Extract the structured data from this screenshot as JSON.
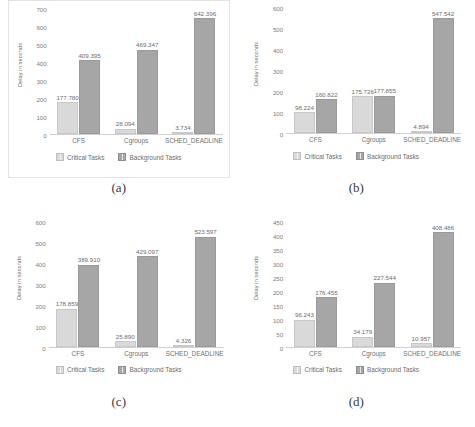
{
  "figure": {
    "background": "#ffffff",
    "colors": {
      "critical": "#d9d9d9",
      "background": "#a6a6a6",
      "text": "#707070",
      "frame": "#e3e3e3"
    }
  },
  "panels": [
    {
      "caption": "(a)",
      "framed": true,
      "chart_data": {
        "type": "bar",
        "title": "",
        "xlabel": "",
        "ylabel": "Delay in seconds",
        "categories": [
          "CFS",
          "Cgroups",
          "SCHED_DEADLINE"
        ],
        "series": [
          {
            "name": "Critical Tasks",
            "values": [
              177.78,
              28.094,
              3.734
            ],
            "labels": [
              "177.780",
              "28.094",
              "3.734"
            ]
          },
          {
            "name": "Background Tasks",
            "values": [
              409.395,
              469.347,
              642.396
            ],
            "labels": [
              "409.395",
              "469.347",
              "642.396"
            ]
          }
        ],
        "yticks": [
          700,
          600,
          500,
          400,
          300,
          200,
          100,
          0
        ],
        "ytick_labels": [
          "700",
          "600",
          "500",
          "400",
          "300",
          "200",
          "100",
          "0"
        ],
        "ylim": [
          0,
          700
        ],
        "grid": false,
        "legend": [
          "Critical Tasks",
          "Background Tasks"
        ],
        "legend_position": "bottom"
      }
    },
    {
      "caption": "(b)",
      "framed": false,
      "chart_data": {
        "type": "bar",
        "title": "",
        "xlabel": "",
        "ylabel": "Delay in seconds",
        "categories": [
          "CFS",
          "Cgroups",
          "SCHED_DEADLINE"
        ],
        "series": [
          {
            "name": "Critical Tasks",
            "values": [
              98.224,
              175.726,
              4.894
            ],
            "labels": [
              "98.224",
              "175.726",
              "4.894"
            ]
          },
          {
            "name": "Background Tasks",
            "values": [
              160.822,
              177.855,
              547.542
            ],
            "labels": [
              "160.822",
              "177.855",
              "547.542"
            ]
          }
        ],
        "yticks": [
          600,
          500,
          400,
          300,
          200,
          100,
          0
        ],
        "ytick_labels": [
          "600",
          "500",
          "400",
          "300",
          "200",
          "100",
          "0"
        ],
        "ylim": [
          0,
          600
        ],
        "grid": false,
        "legend": [
          "Critical Tasks",
          "Background Tasks"
        ],
        "legend_position": "bottom"
      }
    },
    {
      "caption": "(c)",
      "framed": false,
      "chart_data": {
        "type": "bar",
        "title": "",
        "xlabel": "",
        "ylabel": "Delay in seconds",
        "categories": [
          "CFS",
          "Cgroups",
          "SCHED_DEADLINE"
        ],
        "series": [
          {
            "name": "Critical Tasks",
            "values": [
              178.859,
              25.89,
              4.326
            ],
            "labels": [
              "178.859",
              "25.890",
              "4.326"
            ]
          },
          {
            "name": "Background Tasks",
            "values": [
              389.91,
              429.097,
              523.597
            ],
            "labels": [
              "389.910",
              "429.097",
              "523.597"
            ]
          }
        ],
        "yticks": [
          600,
          500,
          400,
          300,
          200,
          100,
          0
        ],
        "ytick_labels": [
          "600",
          "500",
          "400",
          "300",
          "200",
          "100",
          "0"
        ],
        "ylim": [
          0,
          600
        ],
        "grid": false,
        "legend": [
          "Critical Tasks",
          "Background Tasks"
        ],
        "legend_position": "bottom"
      }
    },
    {
      "caption": "(d)",
      "framed": false,
      "chart_data": {
        "type": "bar",
        "title": "",
        "xlabel": "",
        "ylabel": "Delay in seconds",
        "categories": [
          "CFS",
          "Cgroups",
          "SCHED_DEADLINE"
        ],
        "series": [
          {
            "name": "Critical Tasks",
            "values": [
              96.243,
              34.179,
              10.957
            ],
            "labels": [
              "96.243",
              "34.179",
              "10.957"
            ]
          },
          {
            "name": "Background Tasks",
            "values": [
              176.455,
              227.544,
              408.486
            ],
            "labels": [
              "176.455",
              "227.544",
              "408.486"
            ]
          }
        ],
        "yticks": [
          450,
          400,
          350,
          300,
          250,
          200,
          150,
          100,
          50,
          0
        ],
        "ytick_labels": [
          "450",
          "400",
          "350",
          "300",
          "250",
          "200",
          "150",
          "100",
          "50",
          "0"
        ],
        "ylim": [
          0,
          450
        ],
        "grid": false,
        "legend": [
          "Critical Tasks",
          "Background Tasks"
        ],
        "legend_position": "bottom"
      }
    }
  ]
}
